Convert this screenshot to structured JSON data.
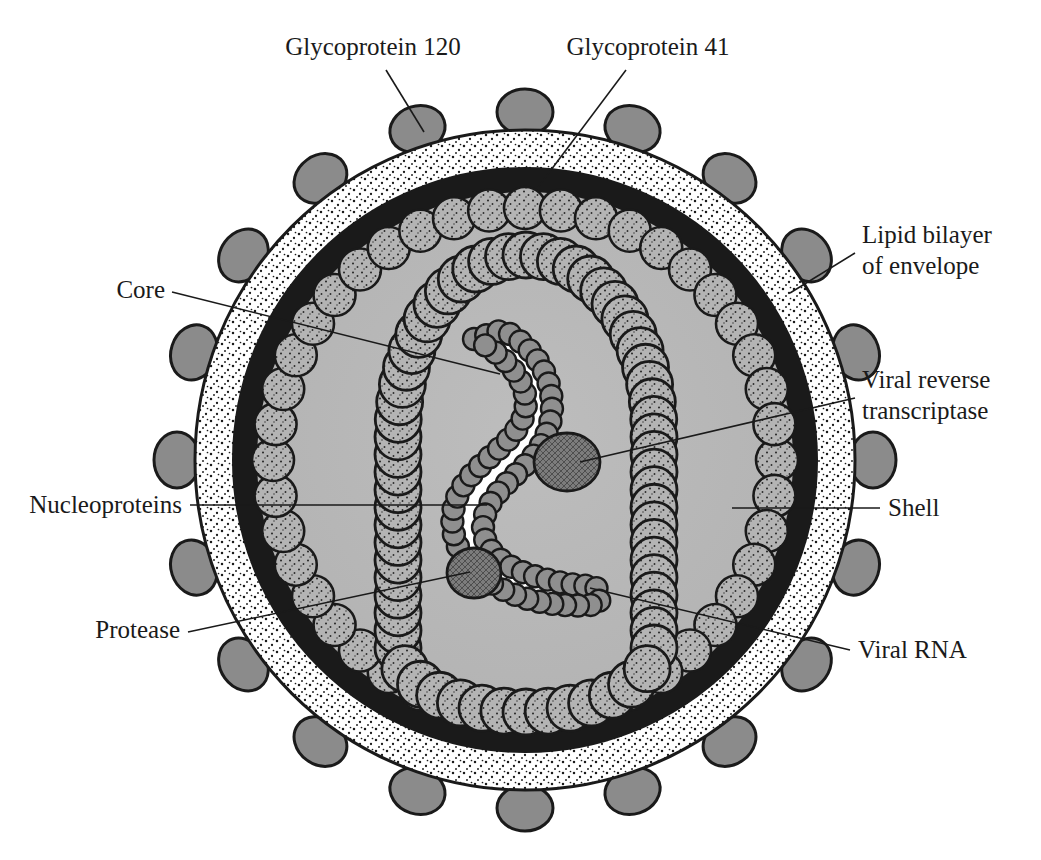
{
  "figure": {
    "background_color": "#ffffff",
    "ink_color": "#1a1a1a"
  },
  "labels": [
    {
      "id": "glycoprotein-120",
      "lines": [
        "Glycoprotein 120"
      ],
      "anchor": "middle",
      "x": 373,
      "y": 55,
      "leader": {
        "x1": 386,
        "y1": 70,
        "x2": 424,
        "y2": 132
      },
      "target": "gp120-knob"
    },
    {
      "id": "glycoprotein-41",
      "lines": [
        "Glycoprotein 41"
      ],
      "anchor": "middle",
      "x": 648,
      "y": 55,
      "leader": {
        "x1": 626,
        "y1": 70,
        "x2": 536,
        "y2": 190
      },
      "target": "gp41-stalk"
    },
    {
      "id": "lipid-bilayer-of-envelope",
      "lines": [
        "Lipid bilayer",
        "of envelope"
      ],
      "anchor": "start",
      "x": 862,
      "y": 243,
      "leader": {
        "x1": 855,
        "y1": 253,
        "x2": 790,
        "y2": 293
      },
      "target": "lipid-bilayer-ring"
    },
    {
      "id": "viral-reverse-transcriptase",
      "lines": [
        "Viral reverse",
        "transcriptase"
      ],
      "anchor": "start",
      "x": 862,
      "y": 388,
      "leader": {
        "x1": 855,
        "y1": 398,
        "x2": 580,
        "y2": 462
      },
      "target": "reverse-transcriptase-body"
    },
    {
      "id": "shell",
      "lines": [
        "Shell"
      ],
      "anchor": "start",
      "x": 888,
      "y": 516,
      "leader": {
        "x1": 880,
        "y1": 508,
        "x2": 732,
        "y2": 508
      },
      "target": "shell-layer"
    },
    {
      "id": "viral-rna",
      "lines": [
        "Viral RNA"
      ],
      "anchor": "start",
      "x": 858,
      "y": 658,
      "leader": {
        "x1": 850,
        "y1": 650,
        "x2": 590,
        "y2": 588
      },
      "target": "rna-strand-end"
    },
    {
      "id": "core",
      "lines": [
        "Core"
      ],
      "anchor": "end",
      "x": 165,
      "y": 298,
      "leader": {
        "x1": 172,
        "y1": 292,
        "x2": 500,
        "y2": 374
      },
      "target": "core-wall"
    },
    {
      "id": "nucleoproteins",
      "lines": [
        "Nucleoproteins"
      ],
      "anchor": "end",
      "x": 182,
      "y": 513,
      "leader": {
        "x1": 190,
        "y1": 505,
        "x2": 487,
        "y2": 505
      },
      "target": "nucleoprotein-beads"
    },
    {
      "id": "protease",
      "lines": [
        "Protease"
      ],
      "anchor": "end",
      "x": 180,
      "y": 638,
      "leader": {
        "x1": 188,
        "y1": 632,
        "x2": 470,
        "y2": 572
      },
      "target": "protease-body"
    }
  ],
  "virion": {
    "center_x": 525,
    "center_y": 460,
    "outer_radius": 332,
    "stipple_band_outer_radius": 330,
    "stipple_band_inner_radius": 292,
    "bilayer_outer_radius": 292,
    "bilayer_inner_radius": 268,
    "shell_ring_radius": 252,
    "shell_bead_radius": 21,
    "shell_bead_count": 44,
    "interior_radius": 232,
    "spike_count": 20,
    "spike_knob_rx": 28,
    "spike_knob_ry": 23,
    "colors": {
      "spike_knob": "#8b8b8b",
      "spike_stalk": "#7a7a7a",
      "stipple_band": "#ffffff",
      "lipid_bilayer": "#1a1a1a",
      "shell_bead": "#b4b4b4",
      "core_interior": "#b0b0b0",
      "envelope_interior": "#b8b8b8",
      "core_bead": "#bcbcbc",
      "nucleoprotein_bead": "#8f8f8f",
      "enzyme_body": "#7c7c7c",
      "rna_ribbon": "#ffffff"
    }
  },
  "core_chain": {
    "description": "Inverted-U chain of stippled spheres forming the conical core wall",
    "bead_radius": 23,
    "bead_count": 52
  },
  "rna_complex": {
    "description": "White RNA ribbon coated with nucleoprotein beads, S-shaped",
    "nucleoprotein_bead_radius": 11,
    "nucleoprotein_bead_count": 66,
    "enzymes": [
      {
        "id": "reverse-transcriptase-body",
        "cx": 567,
        "cy": 462,
        "rx": 33,
        "ry": 29
      },
      {
        "id": "protease-body",
        "cx": 474,
        "cy": 573,
        "rx": 27,
        "ry": 25
      }
    ]
  }
}
